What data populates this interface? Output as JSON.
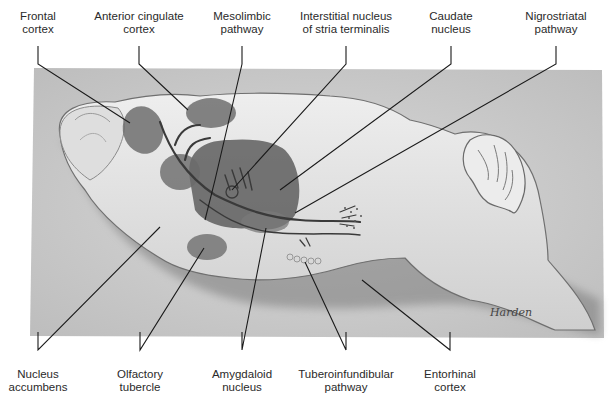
{
  "diagram": {
    "top_labels": [
      {
        "line1": "Frontal",
        "line2": "cortex",
        "x": 30
      },
      {
        "line1": "Anterior cingulate",
        "line2": "cortex",
        "x": 139
      },
      {
        "line1": "Mesolimbic",
        "line2": "pathway",
        "x": 242
      },
      {
        "line1": "Interstitial nucleus",
        "line2": "of stria terminalis",
        "x": 346
      },
      {
        "line1": "Caudate",
        "line2": "nucleus",
        "x": 451
      },
      {
        "line1": "Nigrostriatal",
        "line2": "pathway",
        "x": 556
      }
    ],
    "bottom_labels": [
      {
        "line1": "Nucleus",
        "line2": "accumbens",
        "x": 38
      },
      {
        "line1": "Olfactory",
        "line2": "tubercle",
        "x": 140
      },
      {
        "line1": "Amygdaloid",
        "line2": "nucleus",
        "x": 242
      },
      {
        "line1": "Tuberoinfundibular",
        "line2": "pathway",
        "x": 346
      },
      {
        "line1": "Entorhinal",
        "line2": "cortex",
        "x": 450
      }
    ],
    "signature": "Harden"
  }
}
